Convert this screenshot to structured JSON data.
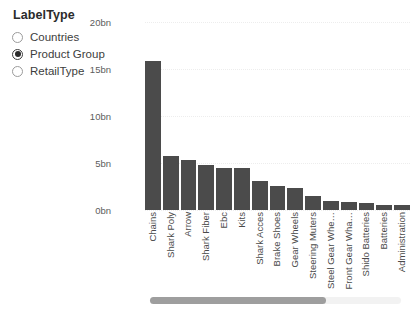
{
  "slicer": {
    "title": "LabelType",
    "options": [
      {
        "label": "Countries",
        "selected": false
      },
      {
        "label": "Product Group",
        "selected": true
      },
      {
        "label": "RetailType",
        "selected": false
      }
    ]
  },
  "scrollbar": {
    "orientation": "horizontal",
    "thumb_fraction": 0.7
  },
  "colors": {
    "bar": "#4b4b4b",
    "gridline": "#ededed",
    "axis_text": "#5c5c5c",
    "scroll_thumb": "#9e9e9e",
    "scroll_track": "#f2f2f2"
  },
  "chart_data": {
    "type": "bar",
    "title": "",
    "xlabel": "",
    "ylabel": "",
    "ylim": [
      0,
      20
    ],
    "yticks": [
      0,
      5,
      10,
      15,
      20
    ],
    "ytick_labels": [
      "0bn",
      "5bn",
      "10bn",
      "15bn",
      "20bn"
    ],
    "grid": true,
    "legend": "none",
    "categories": [
      "Chains",
      "Shark Poly",
      "Arrow",
      "Shark Fiber",
      "Ebc",
      "Kits",
      "Shark Acces",
      "Brake Shoes",
      "Gear Wheels",
      "Steering Muters",
      "Steel Gear Whe…",
      "Front Gear Wha…",
      "Shido Batteries",
      "Batteries",
      "Administration"
    ],
    "values": [
      15.9,
      5.7,
      5.3,
      4.8,
      4.5,
      4.5,
      3.1,
      2.6,
      2.3,
      1.5,
      0.95,
      0.8,
      0.7,
      0.55,
      0.5
    ]
  }
}
